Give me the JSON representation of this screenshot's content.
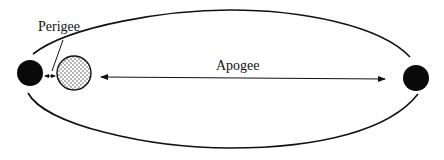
{
  "diagram": {
    "labels": {
      "perigee": "Perigee",
      "apogee": "Apogee"
    },
    "colors": {
      "stroke": "#111111",
      "planet_fill": "#0a0a0a",
      "satellite_fill": "#ffffff",
      "dot_color": "#333333"
    },
    "elements": [
      {
        "id": "left-body",
        "type": "solid-disc"
      },
      {
        "id": "orbiting-body",
        "type": "dotted-circle"
      },
      {
        "id": "right-body",
        "type": "solid-disc"
      },
      {
        "id": "orbit",
        "type": "ellipse"
      },
      {
        "id": "perigee-arrow",
        "type": "double-arrow"
      },
      {
        "id": "apogee-arrow",
        "type": "double-arrow"
      }
    ]
  }
}
